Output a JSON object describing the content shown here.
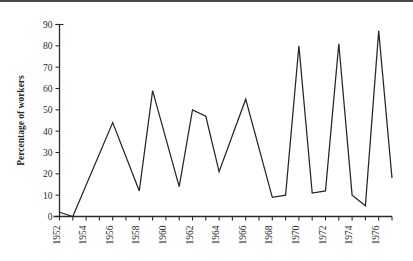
{
  "chart_data": {
    "type": "line",
    "title": "",
    "xlabel": "",
    "ylabel": "Percentage of workers",
    "xlim": [
      1952,
      1977
    ],
    "ylim": [
      0,
      90
    ],
    "yticks": [
      0,
      10,
      20,
      30,
      40,
      50,
      60,
      70,
      80,
      90
    ],
    "ytick_labels": [
      "0",
      "10",
      "20",
      "30",
      "40",
      "50",
      "60",
      "70",
      "80",
      "90"
    ],
    "xticks": [
      1952,
      1953,
      1954,
      1955,
      1956,
      1957,
      1958,
      1959,
      1960,
      1961,
      1962,
      1963,
      1964,
      1965,
      1966,
      1967,
      1968,
      1969,
      1970,
      1971,
      1972,
      1973,
      1974,
      1975,
      1976,
      1977
    ],
    "xtick_labels": [
      "1952",
      "",
      "1954",
      "",
      "1956",
      "",
      "1958",
      "",
      "1960",
      "",
      "1962",
      "",
      "1964",
      "",
      "1966",
      "",
      "1968",
      "",
      "1970",
      "",
      "1972",
      "",
      "1974",
      "",
      "1976",
      ""
    ],
    "grid": false,
    "legend": false,
    "line_color": "#262626",
    "x": [
      1952,
      1953,
      1956,
      1958,
      1959,
      1961,
      1962,
      1963,
      1964,
      1966,
      1968,
      1969,
      1970,
      1971,
      1972,
      1973,
      1974,
      1975,
      1976,
      1977
    ],
    "values": [
      2,
      0,
      44,
      12,
      59,
      14,
      50,
      47,
      21,
      55,
      9,
      10,
      80,
      11,
      12,
      81,
      10,
      5,
      87,
      18
    ],
    "series": [
      {
        "name": "Percentage of workers",
        "x": [
          1952,
          1953,
          1956,
          1958,
          1959,
          1961,
          1962,
          1963,
          1964,
          1966,
          1968,
          1969,
          1970,
          1971,
          1972,
          1973,
          1974,
          1975,
          1976,
          1977
        ],
        "values": [
          2,
          0,
          44,
          12,
          59,
          14,
          50,
          47,
          21,
          55,
          9,
          10,
          80,
          11,
          12,
          81,
          10,
          5,
          87,
          18
        ]
      }
    ]
  }
}
